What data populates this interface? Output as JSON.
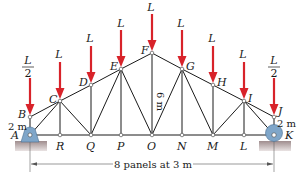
{
  "figure": {
    "type": "truss",
    "colors": {
      "load_arrow": "#d8232a",
      "member": "#1a1a1a",
      "support_fill": "#7fa6c9",
      "ground_fill": "#b7a9aa"
    }
  },
  "nodes": {
    "top": [
      {
        "id": "B",
        "label": "B",
        "x": 30,
        "y": 117
      },
      {
        "id": "C",
        "label": "C",
        "x": 60,
        "y": 101
      },
      {
        "id": "D",
        "label": "D",
        "x": 91,
        "y": 85
      },
      {
        "id": "E",
        "label": "E",
        "x": 121,
        "y": 69
      },
      {
        "id": "F",
        "label": "F",
        "x": 152,
        "y": 53
      },
      {
        "id": "G",
        "label": "G",
        "x": 182,
        "y": 69
      },
      {
        "id": "H",
        "label": "H",
        "x": 213,
        "y": 85
      },
      {
        "id": "I",
        "label": "I",
        "x": 244,
        "y": 101
      },
      {
        "id": "J",
        "label": "J",
        "x": 274,
        "y": 117
      }
    ],
    "bottom": [
      {
        "id": "A",
        "label": "A",
        "x": 30,
        "y": 135
      },
      {
        "id": "R",
        "label": "R",
        "x": 60,
        "y": 135
      },
      {
        "id": "Q",
        "label": "Q",
        "x": 91,
        "y": 135
      },
      {
        "id": "P",
        "label": "P",
        "x": 121,
        "y": 135
      },
      {
        "id": "O",
        "label": "O",
        "x": 152,
        "y": 135
      },
      {
        "id": "N",
        "label": "N",
        "x": 182,
        "y": 135
      },
      {
        "id": "M",
        "label": "M",
        "x": 213,
        "y": 135
      },
      {
        "id": "L",
        "label": "L",
        "x": 244,
        "y": 135
      },
      {
        "id": "K",
        "label": "K",
        "x": 274,
        "y": 135
      }
    ]
  },
  "loads": [
    {
      "node": "B",
      "label_num": "L",
      "label_den": "2"
    },
    {
      "node": "C",
      "label": "L"
    },
    {
      "node": "D",
      "label": "L"
    },
    {
      "node": "E",
      "label": "L"
    },
    {
      "node": "F",
      "label": "L"
    },
    {
      "node": "G",
      "label": "L"
    },
    {
      "node": "H",
      "label": "L"
    },
    {
      "node": "I",
      "label": "L"
    },
    {
      "node": "J",
      "label_num": "L",
      "label_den": "2"
    }
  ],
  "dimensions": {
    "left_height": "2 m",
    "right_height": "2 m",
    "center_height": "6 m",
    "span": "8 panels at 3 m"
  },
  "supports": {
    "left": {
      "node": "A",
      "type": "pin"
    },
    "right": {
      "node": "K",
      "type": "roller"
    }
  }
}
